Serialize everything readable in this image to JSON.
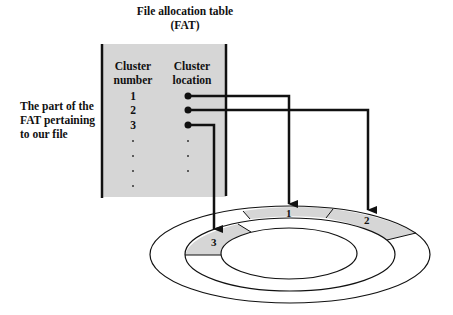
{
  "diagram": {
    "title_line1": "File allocation table",
    "title_line2": "(FAT)",
    "side_label": [
      "The part of the",
      "FAT pertaining",
      "to our file"
    ],
    "table": {
      "headers": {
        "number_line1": "Cluster",
        "number_line2": "number",
        "location_line1": "Cluster",
        "location_line2": "location"
      },
      "rows": [
        {
          "number": "1",
          "location": "pointer-to-segment-1"
        },
        {
          "number": "2",
          "location": "pointer-to-segment-2"
        },
        {
          "number": "3",
          "location": "pointer-to-segment-3"
        }
      ],
      "ellipsis_rows_number": 4,
      "ellipsis_rows_location": 3,
      "fill_color": "#d6d6d6"
    },
    "disk": {
      "segments": [
        {
          "label": "1",
          "ring": "outer"
        },
        {
          "label": "2",
          "ring": "outer"
        },
        {
          "label": "3",
          "ring": "inner"
        }
      ],
      "segment_fill": "#d6d6d6",
      "line_color": "#111111"
    }
  }
}
